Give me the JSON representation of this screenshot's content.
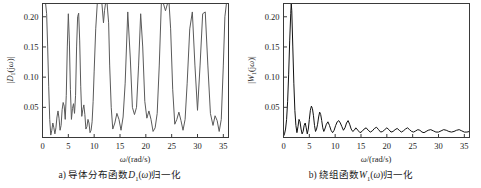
{
  "figure": {
    "background": "#ffffff",
    "line_color_a": "#5a5a5a",
    "line_color_b": "#111111",
    "axis_color": "#3a3a3a"
  },
  "panels": [
    {
      "id": "a",
      "caption_prefix": "a)",
      "caption_text": "导体分布函数",
      "caption_symbol": "D",
      "caption_symbol_sub": "1",
      "caption_arg": "(ω)",
      "caption_suffix": "归一化",
      "caption_full": "a) 导体分布函数D1(ω)归一化",
      "ylabel_full": "|D1(jω)|",
      "xlabel_full": "ω/(rad/s)"
    },
    {
      "id": "b",
      "caption_prefix": "b)",
      "caption_text": "绕组函数",
      "caption_symbol": "W",
      "caption_symbol_sub": "1",
      "caption_arg": "(ω)",
      "caption_suffix": "归一化",
      "caption_full": "b) 绕组函数W1(ω)归一化",
      "ylabel_full": "|W1(jω)|",
      "xlabel_full": "ω/(rad/s)"
    }
  ],
  "chart_data": [
    {
      "type": "line",
      "id": "panel-a",
      "title": "a) 导体分布函数D1(ω)归一化",
      "xlabel": "ω/(rad/s)",
      "ylabel": "|D1(jω)|",
      "xlim": [
        0,
        36
      ],
      "ylim": [
        0,
        0.222
      ],
      "xticks": [
        0,
        5,
        10,
        15,
        20,
        25,
        30,
        35
      ],
      "xticklabels": [
        "0",
        "5",
        "10",
        "15",
        "20",
        "25",
        "30",
        "35"
      ],
      "yticks": [
        0.05,
        0.1,
        0.15,
        0.2
      ],
      "yticklabels": [
        "0.05",
        "0.10",
        "0.15",
        "0.20"
      ],
      "grid": false,
      "legend": null,
      "note": "Clipped comb spectrum; tall lobes run off the top of the axes.",
      "x": [
        0.0,
        0.2,
        0.4,
        0.6,
        0.8,
        1.0,
        1.2,
        1.4,
        1.6,
        1.8,
        2.0,
        2.2,
        2.4,
        2.6,
        2.8,
        3.0,
        3.2,
        3.4,
        3.6,
        3.8,
        4.0,
        4.2,
        4.4,
        4.6,
        4.8,
        5.0,
        5.2,
        5.4,
        5.6,
        5.8,
        6.0,
        6.2,
        6.4,
        6.6,
        6.8,
        7.0,
        7.2,
        7.4,
        7.6,
        7.8,
        8.0,
        8.2,
        8.4,
        8.6,
        8.8,
        9.0,
        9.2,
        9.4,
        9.6,
        9.8,
        10.0,
        10.3,
        10.6,
        10.9,
        11.2,
        11.5,
        11.8,
        12.0,
        12.2,
        12.5,
        12.8,
        13.0,
        13.3,
        13.6,
        14.0,
        14.4,
        14.8,
        15.2,
        15.6,
        16.0,
        16.5,
        17.0,
        17.4,
        17.8,
        18.2,
        18.6,
        19.0,
        19.4,
        19.8,
        20.2,
        20.6,
        21.0,
        21.4,
        21.8,
        22.2,
        22.6,
        23.0,
        23.4,
        23.8,
        24.2,
        24.5,
        24.8,
        25.2,
        25.6,
        26.0,
        26.4,
        26.8,
        27.2,
        27.6,
        28.0,
        28.5,
        29.0,
        29.5,
        30.0,
        30.5,
        31.0,
        31.5,
        32.0,
        32.5,
        33.0,
        33.4,
        33.8,
        34.2,
        34.6,
        35.0,
        35.3,
        35.6,
        36.0
      ],
      "y": [
        0.222,
        0.222,
        0.222,
        0.222,
        0.205,
        0.15,
        0.085,
        0.03,
        0.004,
        0.012,
        0.024,
        0.016,
        0.006,
        0.016,
        0.034,
        0.044,
        0.032,
        0.012,
        0.02,
        0.046,
        0.058,
        0.052,
        0.03,
        0.07,
        0.15,
        0.205,
        0.16,
        0.08,
        0.03,
        0.048,
        0.056,
        0.04,
        0.07,
        0.15,
        0.2,
        0.206,
        0.16,
        0.085,
        0.035,
        0.046,
        0.054,
        0.038,
        0.014,
        0.018,
        0.03,
        0.024,
        0.008,
        0.012,
        0.026,
        0.06,
        0.11,
        0.18,
        0.222,
        0.222,
        0.222,
        0.222,
        0.19,
        0.21,
        0.222,
        0.222,
        0.19,
        0.12,
        0.05,
        0.014,
        0.024,
        0.04,
        0.03,
        0.012,
        0.034,
        0.09,
        0.208,
        0.13,
        0.05,
        0.038,
        0.05,
        0.12,
        0.205,
        0.15,
        0.06,
        0.032,
        0.044,
        0.03,
        0.01,
        0.016,
        0.04,
        0.12,
        0.222,
        0.222,
        0.21,
        0.222,
        0.222,
        0.18,
        0.08,
        0.022,
        0.03,
        0.042,
        0.028,
        0.012,
        0.03,
        0.09,
        0.18,
        0.208,
        0.12,
        0.045,
        0.12,
        0.205,
        0.208,
        0.12,
        0.04,
        0.02,
        0.036,
        0.028,
        0.01,
        0.03,
        0.12,
        0.2,
        0.222,
        0.222
      ]
    },
    {
      "type": "line",
      "id": "panel-b",
      "title": "b) 绕组函数W1(ω)归一化",
      "xlabel": "ω/(rad/s)",
      "ylabel": "|W1(jω)|",
      "xlim": [
        0,
        36
      ],
      "ylim": [
        0,
        0.222
      ],
      "xticks": [
        0,
        5,
        10,
        15,
        20,
        25,
        30,
        35
      ],
      "xticklabels": [
        "0",
        "5",
        "10",
        "15",
        "20",
        "25",
        "30",
        "35"
      ],
      "yticks": [
        0.05,
        0.1,
        0.15,
        0.2
      ],
      "yticklabels": [
        "0.05",
        "0.10",
        "0.15",
        "0.20"
      ],
      "grid": false,
      "legend": null,
      "note": "Single dominant lobe near ω≈1.5 (>0.21) with rapidly decaying ripple tail.",
      "x": [
        0.0,
        0.2,
        0.4,
        0.6,
        0.8,
        1.0,
        1.2,
        1.4,
        1.5,
        1.6,
        1.8,
        2.0,
        2.2,
        2.4,
        2.6,
        2.8,
        3.0,
        3.2,
        3.4,
        3.6,
        3.8,
        4.0,
        4.2,
        4.4,
        4.6,
        4.8,
        5.0,
        5.2,
        5.4,
        5.6,
        5.8,
        6.0,
        6.2,
        6.4,
        6.6,
        6.8,
        7.0,
        7.2,
        7.4,
        7.6,
        7.8,
        8.0,
        8.3,
        8.6,
        8.9,
        9.2,
        9.5,
        9.8,
        10.1,
        10.4,
        10.7,
        11.0,
        11.3,
        11.6,
        11.9,
        12.2,
        12.5,
        12.8,
        13.1,
        13.4,
        13.7,
        14.0,
        14.4,
        14.8,
        15.2,
        15.6,
        16.0,
        16.4,
        16.8,
        17.2,
        17.6,
        18.0,
        18.4,
        18.8,
        19.2,
        19.6,
        20.0,
        20.4,
        20.8,
        21.2,
        21.6,
        22.0,
        22.4,
        22.8,
        23.2,
        23.6,
        24.0,
        24.4,
        24.8,
        25.2,
        25.6,
        26.0,
        26.4,
        26.8,
        27.2,
        27.6,
        28.0,
        28.5,
        29.0,
        29.5,
        30.0,
        30.5,
        31.0,
        31.5,
        32.0,
        32.5,
        33.0,
        33.5,
        34.0,
        34.5,
        35.0,
        35.5,
        36.0
      ],
      "y": [
        0.002,
        0.006,
        0.014,
        0.03,
        0.06,
        0.105,
        0.16,
        0.205,
        0.222,
        0.21,
        0.15,
        0.09,
        0.045,
        0.02,
        0.008,
        0.018,
        0.03,
        0.026,
        0.014,
        0.006,
        0.01,
        0.02,
        0.024,
        0.016,
        0.006,
        0.014,
        0.03,
        0.045,
        0.052,
        0.048,
        0.036,
        0.02,
        0.01,
        0.014,
        0.022,
        0.034,
        0.042,
        0.038,
        0.028,
        0.016,
        0.01,
        0.014,
        0.022,
        0.026,
        0.02,
        0.012,
        0.008,
        0.012,
        0.02,
        0.026,
        0.028,
        0.024,
        0.018,
        0.012,
        0.016,
        0.024,
        0.028,
        0.022,
        0.014,
        0.01,
        0.012,
        0.016,
        0.012,
        0.008,
        0.01,
        0.014,
        0.016,
        0.012,
        0.009,
        0.011,
        0.015,
        0.017,
        0.013,
        0.009,
        0.01,
        0.013,
        0.016,
        0.013,
        0.009,
        0.01,
        0.013,
        0.015,
        0.012,
        0.009,
        0.011,
        0.014,
        0.016,
        0.013,
        0.01,
        0.009,
        0.011,
        0.013,
        0.012,
        0.009,
        0.008,
        0.01,
        0.012,
        0.013,
        0.011,
        0.009,
        0.009,
        0.011,
        0.013,
        0.012,
        0.01,
        0.009,
        0.01,
        0.012,
        0.013,
        0.011,
        0.009,
        0.009,
        0.01
      ]
    }
  ]
}
